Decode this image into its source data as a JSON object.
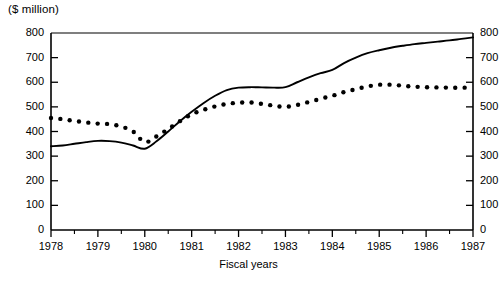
{
  "chart_data": {
    "type": "line",
    "title": "",
    "unit_label": "($ million)",
    "xlabel": "Fiscal years",
    "ylabel": "($ million)",
    "x": [
      1978,
      1979,
      1980,
      1981,
      1982,
      1983,
      1984,
      1985,
      1986,
      1987
    ],
    "categories": [
      "1978",
      "1979",
      "1980",
      "1981",
      "1982",
      "1983",
      "1984",
      "1985",
      "1986",
      "1987"
    ],
    "xlim": [
      1978,
      1987
    ],
    "ylim": [
      0,
      800
    ],
    "y_ticks": [
      0,
      100,
      200,
      300,
      400,
      500,
      600,
      700,
      800
    ],
    "y_tick_labels_left": [
      "0",
      "100",
      "200",
      "300",
      "400",
      "500",
      "600",
      "700",
      "800"
    ],
    "y_tick_labels_right": [
      "0",
      "100",
      "200",
      "300",
      "400",
      "500",
      "600",
      "700",
      "800"
    ],
    "right_axis_labels_clipped": true,
    "x_minor_ticks_per_interval": 1,
    "grid": false,
    "legend": "none",
    "series": [
      {
        "name": "solid-line",
        "style": "solid",
        "values": [
          340,
          362,
          330,
          480,
          578,
          580,
          650,
          730,
          760,
          782
        ]
      },
      {
        "name": "dotted-line",
        "style": "dotted",
        "values": [
          455,
          432,
          357,
          470,
          517,
          500,
          545,
          590,
          580,
          578
        ]
      }
    ],
    "series_dense": {
      "solid": [
        [
          1978.0,
          340
        ],
        [
          1978.25,
          343
        ],
        [
          1978.5,
          350
        ],
        [
          1978.75,
          357
        ],
        [
          1979.0,
          362
        ],
        [
          1979.25,
          361
        ],
        [
          1979.5,
          355
        ],
        [
          1979.75,
          343
        ],
        [
          1980.0,
          330
        ],
        [
          1980.25,
          360
        ],
        [
          1980.5,
          400
        ],
        [
          1980.75,
          442
        ],
        [
          1981.0,
          480
        ],
        [
          1981.25,
          515
        ],
        [
          1981.5,
          545
        ],
        [
          1981.75,
          568
        ],
        [
          1982.0,
          578
        ],
        [
          1982.25,
          580
        ],
        [
          1982.5,
          579
        ],
        [
          1982.75,
          578
        ],
        [
          1983.0,
          580
        ],
        [
          1983.25,
          600
        ],
        [
          1983.5,
          620
        ],
        [
          1983.75,
          637
        ],
        [
          1984.0,
          650
        ],
        [
          1984.25,
          678
        ],
        [
          1984.5,
          700
        ],
        [
          1984.75,
          718
        ],
        [
          1985.0,
          730
        ],
        [
          1985.25,
          740
        ],
        [
          1985.5,
          748
        ],
        [
          1985.75,
          755
        ],
        [
          1986.0,
          760
        ],
        [
          1986.25,
          765
        ],
        [
          1986.5,
          770
        ],
        [
          1986.75,
          776
        ],
        [
          1987.0,
          782
        ]
      ],
      "dotted": [
        [
          1978.0,
          455
        ],
        [
          1978.25,
          450
        ],
        [
          1978.5,
          443
        ],
        [
          1978.75,
          437
        ],
        [
          1979.0,
          432
        ],
        [
          1979.25,
          430
        ],
        [
          1979.5,
          420
        ],
        [
          1979.75,
          400
        ],
        [
          1980.0,
          357
        ],
        [
          1980.25,
          380
        ],
        [
          1980.5,
          410
        ],
        [
          1980.75,
          442
        ],
        [
          1981.0,
          470
        ],
        [
          1981.25,
          488
        ],
        [
          1981.5,
          502
        ],
        [
          1981.75,
          512
        ],
        [
          1982.0,
          517
        ],
        [
          1982.25,
          518
        ],
        [
          1982.5,
          512
        ],
        [
          1982.75,
          505
        ],
        [
          1983.0,
          500
        ],
        [
          1983.25,
          508
        ],
        [
          1983.5,
          520
        ],
        [
          1983.75,
          533
        ],
        [
          1984.0,
          545
        ],
        [
          1984.25,
          560
        ],
        [
          1984.5,
          572
        ],
        [
          1984.75,
          583
        ],
        [
          1985.0,
          590
        ],
        [
          1985.25,
          590
        ],
        [
          1985.5,
          586
        ],
        [
          1985.75,
          582
        ],
        [
          1986.0,
          580
        ],
        [
          1986.25,
          579
        ],
        [
          1986.5,
          578
        ],
        [
          1986.75,
          578
        ],
        [
          1987.0,
          578
        ]
      ]
    }
  },
  "colors": {
    "axis": "#000000",
    "series_solid": "#000000",
    "series_dotted": "#000000",
    "background": "#ffffff"
  }
}
